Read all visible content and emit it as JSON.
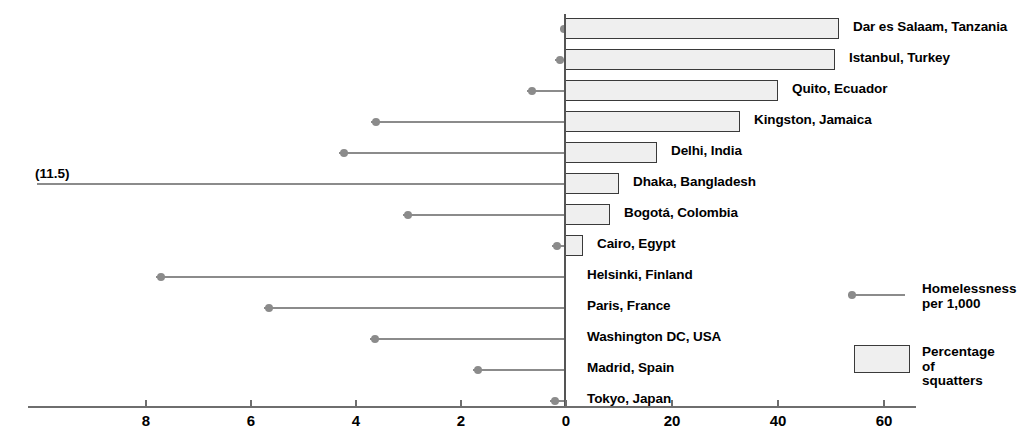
{
  "chart_data": {
    "type": "bar",
    "title": "",
    "subtitle": "",
    "orientation": "horizontal",
    "grid": false,
    "legend_position": "right",
    "categories": [
      "Dar es Salaam, Tanzania",
      "Istanbul, Turkey",
      "Quito, Ecuador",
      "Kingston, Jamaica",
      "Delhi, India",
      "Dhaka, Bangladesh",
      "Bogotá, Colombia",
      "Cairo, Egypt",
      "Helsinki, Finland",
      "Paris, France",
      "Washington DC, USA",
      "Madrid, Spain",
      "Tokyo, Japan"
    ],
    "series": [
      {
        "name": "Percentage of squatters",
        "axis": "bottom-right",
        "xlabel": "",
        "xlim": [
          0,
          65
        ],
        "ticks": [
          0,
          20,
          40,
          60
        ],
        "values": [
          52,
          51,
          40,
          33,
          17,
          10,
          8.5,
          3,
          0,
          0,
          0,
          0,
          0
        ]
      },
      {
        "name": "Homelessness per 1,000",
        "axis": "bottom-left",
        "xlabel": "",
        "xlim": [
          0,
          9.2
        ],
        "ticks": [
          8,
          6,
          4,
          2,
          0
        ],
        "values": [
          0.05,
          0.1,
          0.6,
          3.6,
          4.2,
          11.5,
          3.0,
          0.15,
          7.7,
          5.6,
          3.6,
          1.65,
          0.2
        ]
      }
    ],
    "annotations": [
      {
        "text": "(11.5)",
        "category": "Dhaka, Bangladesh",
        "series": "Homelessness per 1,000",
        "note": "value exceeds left axis range, line runs off scale"
      }
    ],
    "left_axis_ticks": [
      "8",
      "6",
      "4",
      "2",
      "0"
    ],
    "right_axis_ticks": [
      "0",
      "20",
      "40",
      "60"
    ]
  },
  "legend": {
    "homelessness": {
      "label": "Homelessness\nper 1,000"
    },
    "squatters": {
      "label": "Percentage of\nsquatters"
    }
  },
  "axis": {
    "ticks": [
      {
        "label": "8",
        "x": 145
      },
      {
        "label": "6",
        "x": 250
      },
      {
        "label": "4",
        "x": 355
      },
      {
        "label": "2",
        "x": 460
      },
      {
        "label": "0",
        "x": 565
      },
      {
        "label": "20",
        "x": 671
      },
      {
        "label": "40",
        "x": 777
      },
      {
        "label": "60",
        "x": 883
      }
    ]
  },
  "annotation": {
    "offscale_label": "(11.5)"
  },
  "rows": [
    {
      "label": "Dar es Salaam, Tanzania",
      "top": 14,
      "bar_px": 274,
      "dot_x": 560,
      "stem_w": 5
    },
    {
      "label": "Istanbul, Turkey",
      "top": 45,
      "bar_px": 270,
      "dot_x": 556,
      "stem_w": 10
    },
    {
      "label": "Quito, Ecuador",
      "top": 76,
      "bar_px": 213,
      "dot_x": 528,
      "stem_w": 38
    },
    {
      "label": "Kingston, Jamaica",
      "top": 107,
      "bar_px": 175,
      "dot_x": 372,
      "stem_w": 194
    },
    {
      "label": "Delhi, India",
      "top": 138,
      "bar_px": 92,
      "dot_x": 340,
      "stem_w": 226
    },
    {
      "label": "Dhaka, Bangladesh",
      "top": 169,
      "bar_px": 54,
      "dot_x": -20,
      "stem_w": 528
    },
    {
      "label": "Bogotá, Colombia",
      "top": 200,
      "bar_px": 45,
      "dot_x": 404,
      "stem_w": 162
    },
    {
      "label": "Cairo, Egypt",
      "top": 231,
      "bar_px": 18,
      "dot_x": 553,
      "stem_w": 13
    },
    {
      "label": "Helsinki, Finland",
      "top": 262,
      "bar_px": 0,
      "dot_x": 157,
      "stem_w": 409
    },
    {
      "label": "Paris, France",
      "top": 293,
      "bar_px": 0,
      "dot_x": 265,
      "stem_w": 301
    },
    {
      "label": "Washington DC, USA",
      "top": 324,
      "bar_px": 0,
      "dot_x": 371,
      "stem_w": 195
    },
    {
      "label": "Madrid, Spain",
      "top": 355,
      "bar_px": 0,
      "dot_x": 474,
      "stem_w": 92
    },
    {
      "label": "Tokyo, Japan",
      "top": 386,
      "bar_px": 0,
      "dot_x": 551,
      "stem_w": 15
    }
  ]
}
